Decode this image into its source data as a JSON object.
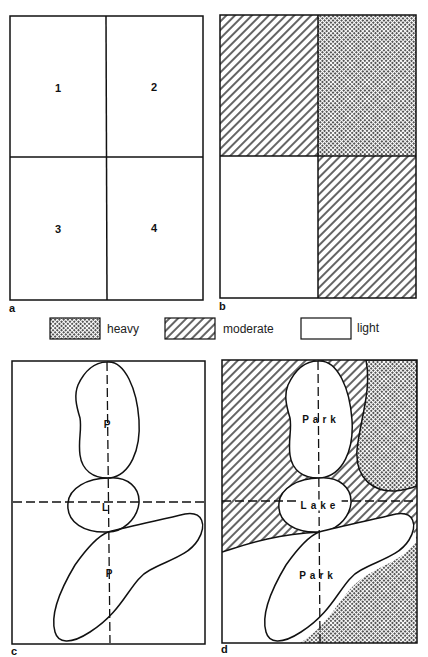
{
  "figure": {
    "panels": [
      {
        "id": "a",
        "caption": "a",
        "quadrants": [
          "1",
          "2",
          "3",
          "4"
        ]
      },
      {
        "id": "b",
        "caption": "b",
        "quadrant_density": {
          "1": "moderate",
          "2": "heavy",
          "3": "light",
          "4": "moderate"
        }
      },
      {
        "id": "c",
        "caption": "c",
        "features": [
          "P",
          "L",
          "P"
        ]
      },
      {
        "id": "d",
        "caption": "d",
        "features": [
          "Park",
          "Lake",
          "Park"
        ]
      }
    ],
    "legend": [
      {
        "key": "heavy",
        "label": "heavy",
        "pattern": "crosshatch"
      },
      {
        "key": "moderate",
        "label": "moderate",
        "pattern": "diagonal-hatch"
      },
      {
        "key": "light",
        "label": "light",
        "pattern": "blank"
      }
    ],
    "colors": {
      "ink": "#111111",
      "paper": "#ffffff",
      "heavy_fill": "#8a8a8a"
    }
  }
}
